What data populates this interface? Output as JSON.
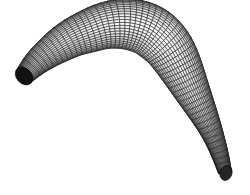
{
  "figure": {
    "background_color": "#ffffff",
    "canvas": {
      "width": 250,
      "height": 195
    }
  },
  "render": {
    "edge_color": "#1a1a1a",
    "face_color": "#fdfdfd",
    "cap_color_start": "#141414",
    "cap_color_end": "#2a2a2a",
    "shade_light": "#ffffff",
    "shade_dark": "#808080",
    "edge_width_main": 0.55,
    "edge_width_dense": 0.4,
    "mesh_columns": 56,
    "mesh_rows": 26
  },
  "chart_data": {
    "type": "mesh3d-wireframe",
    "xlabel": "",
    "ylabel": "",
    "grid": false,
    "legend": null,
    "xlim": [
      0,
      250
    ],
    "ylim": [
      0,
      195
    ],
    "spine_points": [
      {
        "t": 0.0,
        "x": 24,
        "y": 76,
        "radius": 9.5,
        "shade": 0.12
      },
      {
        "t": 0.05,
        "x": 35,
        "y": 64,
        "radius": 12.5,
        "shade": 0.3
      },
      {
        "t": 0.1,
        "x": 47,
        "y": 54,
        "radius": 15.0,
        "shade": 0.52
      },
      {
        "t": 0.15,
        "x": 60,
        "y": 45,
        "radius": 17.5,
        "shade": 0.68
      },
      {
        "t": 0.2,
        "x": 74,
        "y": 37,
        "radius": 19.5,
        "shade": 0.8
      },
      {
        "t": 0.25,
        "x": 89,
        "y": 31,
        "radius": 21.5,
        "shade": 0.88
      },
      {
        "t": 0.3,
        "x": 104,
        "y": 26,
        "radius": 23.0,
        "shade": 0.93
      },
      {
        "t": 0.35,
        "x": 119,
        "y": 24,
        "radius": 24.5,
        "shade": 0.96
      },
      {
        "t": 0.4,
        "x": 133,
        "y": 25,
        "radius": 25.5,
        "shade": 0.97
      },
      {
        "t": 0.45,
        "x": 146,
        "y": 29,
        "radius": 26.0,
        "shade": 0.96
      },
      {
        "t": 0.5,
        "x": 157,
        "y": 36,
        "radius": 26.0,
        "shade": 0.93
      },
      {
        "t": 0.55,
        "x": 167,
        "y": 46,
        "radius": 25.0,
        "shade": 0.88
      },
      {
        "t": 0.6,
        "x": 175,
        "y": 58,
        "radius": 23.5,
        "shade": 0.82
      },
      {
        "t": 0.65,
        "x": 182,
        "y": 71,
        "radius": 21.5,
        "shade": 0.75
      },
      {
        "t": 0.7,
        "x": 189,
        "y": 85,
        "radius": 19.0,
        "shade": 0.68
      },
      {
        "t": 0.75,
        "x": 196,
        "y": 99,
        "radius": 16.5,
        "shade": 0.61
      },
      {
        "t": 0.8,
        "x": 203,
        "y": 113,
        "radius": 14.0,
        "shade": 0.54
      },
      {
        "t": 0.85,
        "x": 210,
        "y": 128,
        "radius": 11.5,
        "shade": 0.46
      },
      {
        "t": 0.9,
        "x": 216,
        "y": 143,
        "radius": 9.5,
        "shade": 0.38
      },
      {
        "t": 0.95,
        "x": 221,
        "y": 158,
        "radius": 8.0,
        "shade": 0.28
      },
      {
        "t": 1.0,
        "x": 225,
        "y": 172,
        "radius": 6.5,
        "shade": 0.14
      }
    ],
    "cap_start": {
      "x": 24,
      "y": 76,
      "rx": 7.5,
      "ry": 10.0,
      "rotation": -44,
      "color": "#121212"
    },
    "cap_end": {
      "x": 226,
      "y": 173,
      "rx": 6.0,
      "ry": 7.5,
      "rotation": 18,
      "color": "#262626"
    }
  }
}
